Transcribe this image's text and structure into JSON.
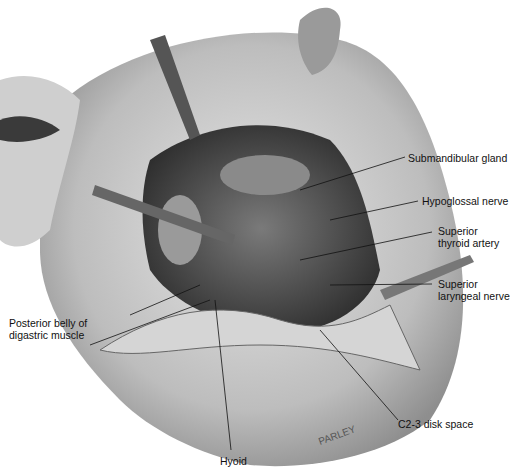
{
  "figure": {
    "type": "surgical-anatomy-illustration",
    "labels": {
      "submandibular_gland": "Submandibular gland",
      "hypoglossal_nerve": "Hypoglossal nerve",
      "superior_thyroid_artery_1": "Superior",
      "superior_thyroid_artery_2": "thyroid artery",
      "superior_laryngeal_nerve_1": "Superior",
      "superior_laryngeal_nerve_2": "laryngeal nerve",
      "posterior_belly_1": "Posterior belly of",
      "posterior_belly_2": "digastric muscle",
      "c23_disk_space": "C2-3 disk space",
      "hyoid": "Hyoid"
    },
    "signature": "PARLEY",
    "colors": {
      "ink": "#111111",
      "skin_light": "#d9d9d9",
      "skin_mid": "#a8a8a8",
      "skin_dark": "#4a4a4a",
      "background": "#ffffff"
    }
  }
}
